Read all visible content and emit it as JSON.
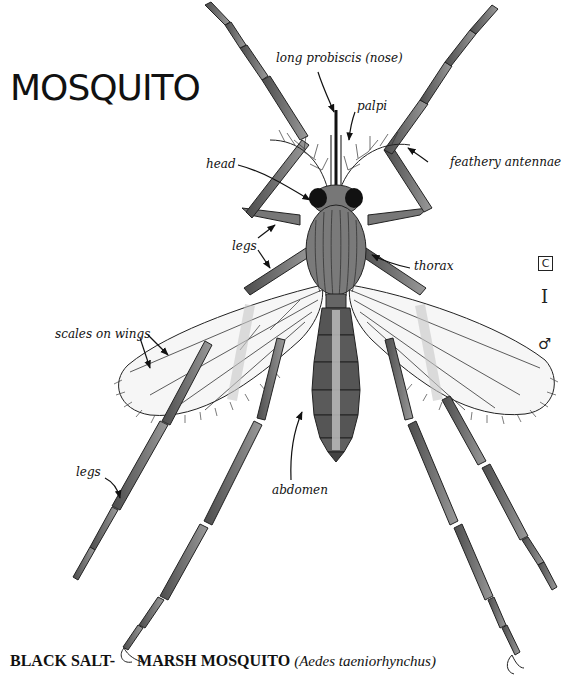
{
  "title": "MOSQUITO",
  "labels": {
    "proboscis": "long probiscis (nose)",
    "palpi": "palpi",
    "head": "head",
    "antennae": "feathery antennae",
    "legs_upper": "legs",
    "thorax": "thorax",
    "wings": "scales on wings",
    "legs_lower": "legs",
    "abdomen": "abdomen"
  },
  "symbols": {
    "box_letter": "C",
    "bar": "I",
    "sex": "♂"
  },
  "caption": {
    "part1": "BLACK SALT-",
    "part2": "MARSH MOSQUITO",
    "scientific": "(Aedes taeniorhynchus)"
  },
  "colors": {
    "ink": "#111111",
    "body_fill": "#7a7a7a",
    "body_dark": "#555555",
    "leg_fill": "#6e6e6e",
    "wing_fill": "#f4f4f4",
    "background": "#ffffff"
  }
}
